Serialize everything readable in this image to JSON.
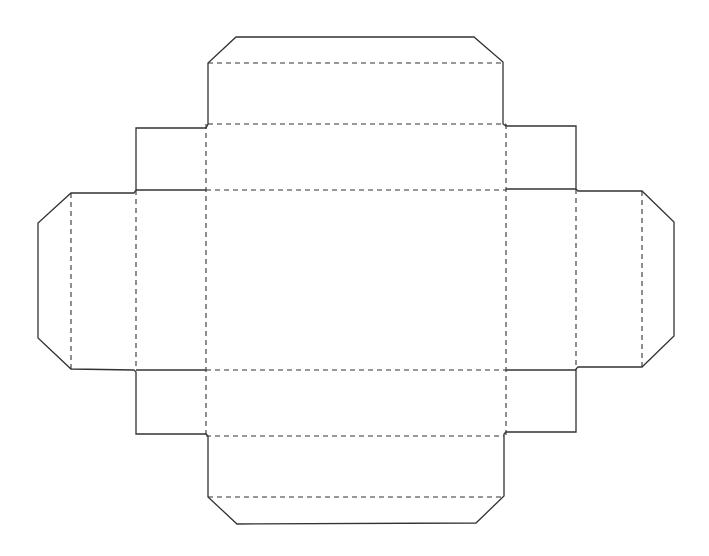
{
  "diagram": {
    "type": "box-net",
    "colors": {
      "background": "#ffffff",
      "cut_line": "#333333",
      "fold_line": "#333333"
    },
    "line_styles": {
      "cut": "solid",
      "fold": "dashed"
    },
    "panels": [
      {
        "name": "base",
        "x1": 206,
        "y1": 190,
        "x2": 506,
        "y2": 370
      },
      {
        "name": "top-wall",
        "x1": 206,
        "y1": 124,
        "x2": 506,
        "y2": 190
      },
      {
        "name": "top-tab",
        "x1": 208,
        "y1": 37,
        "x2": 503,
        "y2": 124
      },
      {
        "name": "bottom-wall",
        "x1": 206,
        "y1": 370,
        "x2": 506,
        "y2": 436
      },
      {
        "name": "bottom-tab",
        "x1": 208,
        "y1": 436,
        "x2": 504,
        "y2": 524
      },
      {
        "name": "left-wall",
        "x1": 136,
        "y1": 128,
        "x2": 206,
        "y2": 434
      },
      {
        "name": "left-tab",
        "x1": 38,
        "y1": 193,
        "x2": 136,
        "y2": 369
      },
      {
        "name": "right-wall",
        "x1": 506,
        "y1": 126,
        "x2": 576,
        "y2": 432
      },
      {
        "name": "right-tab",
        "x1": 576,
        "y1": 191,
        "x2": 674,
        "y2": 367
      }
    ]
  }
}
